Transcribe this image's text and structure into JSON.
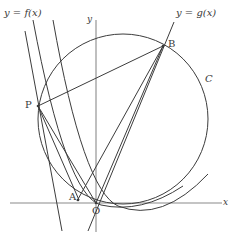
{
  "figure": {
    "type": "geometry-diagram",
    "background_color": "#ffffff",
    "stroke_color": "#3c3c3c",
    "axis_color": "#777777",
    "width": 234,
    "height": 235
  },
  "axes": {
    "x_label": "x",
    "y_label": "y",
    "origin_label": "O",
    "x_axis": {
      "x1": 10,
      "y1": 203,
      "x2": 222,
      "y2": 203
    },
    "y_axis": {
      "x1": 96,
      "y1": 20,
      "x2": 96,
      "y2": 232
    },
    "x_label_pos": {
      "x": 223,
      "y": 203
    },
    "y_label_pos": {
      "x": 88,
      "y": 22
    },
    "origin_label_pos": {
      "x": 93,
      "y": 214
    }
  },
  "labels": {
    "f_label": "y = f(x)",
    "g_label": "y = g(x)",
    "circle_label": "C",
    "point_p": "P",
    "point_a": "A",
    "point_b": "B",
    "f_label_pos": {
      "x": 4,
      "y": 13
    },
    "g_label_pos": {
      "x": 176,
      "y": 13
    },
    "circle_label_pos": {
      "x": 205,
      "y": 79
    },
    "p_label_pos": {
      "x": 25,
      "y": 100
    },
    "a_label_pos": {
      "x": 69,
      "y": 195
    },
    "b_label_pos": {
      "x": 168,
      "y": 40
    }
  },
  "circle": {
    "name": "C",
    "center": {
      "x": 123,
      "y": 119
    },
    "radius": 85
  },
  "points": {
    "P": {
      "x": 38,
      "y": 106
    },
    "B": {
      "x": 163,
      "y": 46
    },
    "A": {
      "x": 78,
      "y": 200
    },
    "O": {
      "x": 96,
      "y": 203
    }
  },
  "segments": [
    {
      "name": "chord-p-b",
      "x1": 38,
      "y1": 106,
      "x2": 163,
      "y2": 46
    },
    {
      "name": "chord-p-a",
      "x1": 38,
      "y1": 106,
      "x2": 79,
      "y2": 200
    },
    {
      "name": "chord-p-o",
      "x1": 38,
      "y1": 106,
      "x2": 96,
      "y2": 203
    },
    {
      "name": "chord-a-b",
      "x1": 77,
      "y1": 201,
      "x2": 163,
      "y2": 46
    },
    {
      "name": "chord-o-b",
      "x1": 96,
      "y1": 203,
      "x2": 163,
      "y2": 46
    }
  ],
  "lines": [
    {
      "name": "line-f",
      "x1": 25,
      "y1": 31,
      "x2": 62,
      "y2": 231
    },
    {
      "name": "line-g",
      "x1": 174,
      "y1": 22,
      "x2": 88,
      "y2": 231
    }
  ],
  "curves": [
    {
      "name": "parabola-through-a",
      "d": "M 33 20 Q 66 196 101 205 Q 141 214 183 186"
    },
    {
      "name": "parabola-through-o",
      "d": "M 53 20 Q 83 190 118 206 Q 162 223 208 174"
    }
  ],
  "chart_data": {
    "type": "scatter",
    "xlabel": "x",
    "ylabel": "y",
    "grid": false,
    "legend": [],
    "annotations": [
      "y = f(x)",
      "y = g(x)",
      "C",
      "P",
      "A",
      "B",
      "O"
    ],
    "points": [
      {
        "label": "P",
        "x": 38,
        "y": 106
      },
      {
        "label": "B",
        "x": 163,
        "y": 46
      },
      {
        "label": "A",
        "x": 78,
        "y": 200
      },
      {
        "label": "O",
        "x": 96,
        "y": 203
      }
    ]
  }
}
